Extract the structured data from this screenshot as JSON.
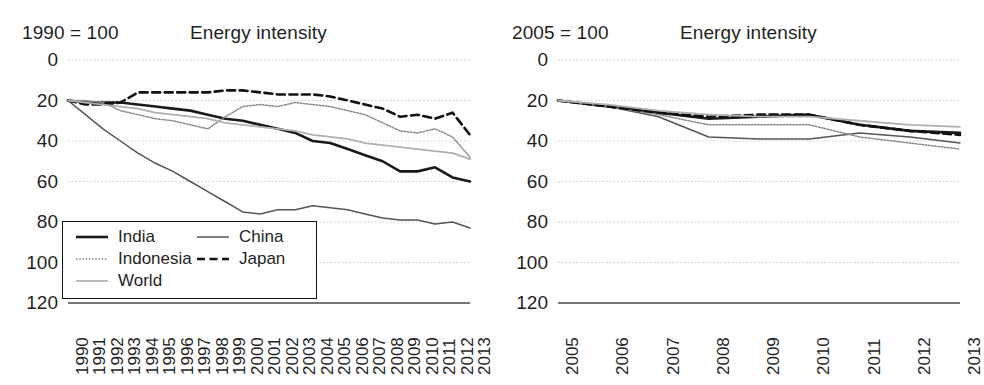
{
  "left": {
    "base_label": "1990 = 100",
    "title": "Energy intensity",
    "yticks": [
      "120",
      "100",
      "80",
      "60",
      "40",
      "20",
      "0"
    ],
    "xticks": [
      "1990",
      "1991",
      "1992",
      "1993",
      "1994",
      "1995",
      "1996",
      "1997",
      "1998",
      "1999",
      "2000",
      "2001",
      "2002",
      "2003",
      "2004",
      "2005",
      "2006",
      "2007",
      "2008",
      "2009",
      "2010",
      "2011",
      "2012",
      "2013"
    ],
    "legend": [
      {
        "label": "India",
        "style": "solid-thick-black"
      },
      {
        "label": "China",
        "style": "solid-thin-gray"
      },
      {
        "label": "Indonesia",
        "style": "dotted-gray"
      },
      {
        "label": "Japan",
        "style": "dashed-black"
      },
      {
        "label": "World",
        "style": "solid-light-gray"
      }
    ]
  },
  "right": {
    "base_label": "2005 = 100",
    "title": "Energy intensity",
    "yticks": [
      "120",
      "100",
      "80",
      "60",
      "40",
      "20",
      "0"
    ],
    "xticks": [
      "2005",
      "2006",
      "2007",
      "2008",
      "2009",
      "2010",
      "2011",
      "2012",
      "2013"
    ]
  },
  "colors": {
    "india": "#1a1a1a",
    "china": "#555555",
    "indonesia": "#8a8a8a",
    "japan": "#111111",
    "world": "#b0b0b0",
    "gridline": "#c9c9c9",
    "axis": "#4a4a4a",
    "text": "#1f1f1f"
  },
  "chart_data": [
    {
      "type": "line",
      "title": "Energy intensity",
      "subtitle": "1990 = 100",
      "xlabel": "",
      "ylabel": "",
      "ylim": [
        0,
        120
      ],
      "yticks": [
        0,
        20,
        40,
        60,
        80,
        100,
        120
      ],
      "grid": true,
      "legend_position": "inside-bottom-left",
      "x": [
        1990,
        1991,
        1992,
        1993,
        1994,
        1995,
        1996,
        1997,
        1998,
        1999,
        2000,
        2001,
        2002,
        2003,
        2004,
        2005,
        2006,
        2007,
        2008,
        2009,
        2010,
        2011,
        2012,
        2013
      ],
      "series": [
        {
          "name": "India",
          "style": "solid-thick-black",
          "values": [
            100,
            99,
            99,
            99,
            98,
            97,
            96,
            95,
            93,
            91,
            90,
            88,
            86,
            84,
            80,
            79,
            76,
            73,
            70,
            65,
            65,
            67,
            62,
            60
          ]
        },
        {
          "name": "China",
          "style": "solid-thin-gray",
          "values": [
            100,
            93,
            86,
            80,
            74,
            69,
            65,
            60,
            55,
            50,
            45,
            44,
            46,
            46,
            48,
            47,
            46,
            44,
            42,
            41,
            41,
            39,
            40,
            37
          ]
        },
        {
          "name": "Indonesia",
          "style": "dotted-gray",
          "values": [
            100,
            100,
            99,
            95,
            93,
            91,
            90,
            88,
            86,
            92,
            97,
            98,
            97,
            99,
            98,
            97,
            95,
            93,
            89,
            85,
            84,
            86,
            82,
            72
          ]
        },
        {
          "name": "Japan",
          "style": "dashed-black",
          "values": [
            100,
            98,
            98,
            99,
            104,
            104,
            104,
            104,
            104,
            105,
            105,
            104,
            103,
            103,
            103,
            102,
            100,
            98,
            96,
            92,
            93,
            91,
            94,
            83
          ]
        },
        {
          "name": "World",
          "style": "solid-light-gray",
          "values": [
            100,
            99,
            98,
            97,
            96,
            94,
            93,
            92,
            91,
            89,
            88,
            87,
            86,
            85,
            83,
            82,
            81,
            79,
            78,
            77,
            76,
            75,
            74,
            71
          ]
        }
      ]
    },
    {
      "type": "line",
      "title": "Energy intensity",
      "subtitle": "2005 = 100",
      "xlabel": "",
      "ylabel": "",
      "ylim": [
        0,
        120
      ],
      "yticks": [
        0,
        20,
        40,
        60,
        80,
        100,
        120
      ],
      "grid": true,
      "legend_position": "none",
      "x": [
        2005,
        2006,
        2007,
        2008,
        2009,
        2010,
        2011,
        2012,
        2013
      ],
      "series": [
        {
          "name": "India",
          "style": "solid-thick-black",
          "values": [
            100,
            97,
            94,
            91,
            92,
            93,
            88,
            85,
            84
          ]
        },
        {
          "name": "China",
          "style": "solid-thin-gray",
          "values": [
            100,
            97,
            92,
            82,
            81,
            81,
            84,
            82,
            79
          ]
        },
        {
          "name": "Indonesia",
          "style": "dotted-gray",
          "values": [
            100,
            97,
            93,
            88,
            88,
            88,
            82,
            79,
            76
          ]
        },
        {
          "name": "Japan",
          "style": "dashed-black",
          "values": [
            100,
            97,
            94,
            92,
            93,
            93,
            88,
            85,
            83
          ]
        },
        {
          "name": "World",
          "style": "solid-light-gray",
          "values": [
            100,
            98,
            95,
            93,
            92,
            92,
            90,
            88,
            87
          ]
        }
      ]
    }
  ]
}
